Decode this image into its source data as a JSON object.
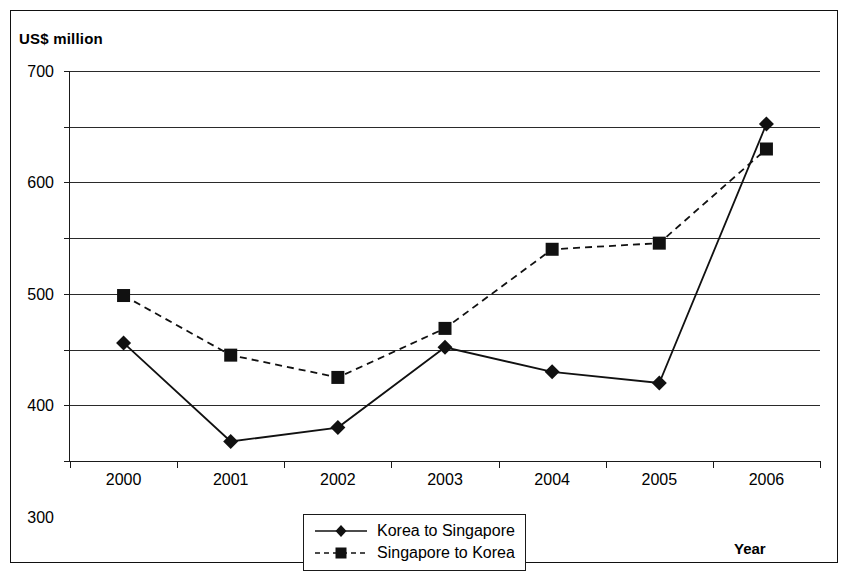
{
  "chart_data": {
    "type": "line",
    "title": "",
    "subtitle": "",
    "ylabel": "US$ million",
    "xlabel": "Year",
    "categories": [
      "2000",
      "2001",
      "2002",
      "2003",
      "2004",
      "2005",
      "2006"
    ],
    "x": [
      2000,
      2001,
      2002,
      2003,
      2004,
      2005,
      2006
    ],
    "ylim": [
      0,
      700
    ],
    "ytick_labels": [
      "700",
      "600",
      "500",
      "400",
      "300",
      "200",
      "100",
      "0"
    ],
    "ytick_values": [
      700,
      600,
      500,
      400,
      300,
      200,
      100,
      0
    ],
    "grid": true,
    "legend_position": "bottom-center",
    "series": [
      {
        "name": "Korea to Singapore",
        "values": [
          212,
          35,
          60,
          204,
          160,
          140,
          605
        ],
        "line_style": "solid",
        "marker": "diamond",
        "color": "#111111"
      },
      {
        "name": "Singapore to Korea",
        "values": [
          297,
          190,
          150,
          238,
          380,
          391,
          560
        ],
        "line_style": "dashed",
        "marker": "square",
        "color": "#111111"
      }
    ]
  },
  "legend": {
    "items": [
      {
        "label": "Korea to Singapore",
        "marker": "diamond-marker-icon",
        "style": "solid"
      },
      {
        "label": "Singapore to Korea",
        "marker": "square-marker-icon",
        "style": "dashed"
      }
    ]
  },
  "axes": {
    "y_axis_title": "US$ million",
    "x_axis_title": "Year"
  }
}
